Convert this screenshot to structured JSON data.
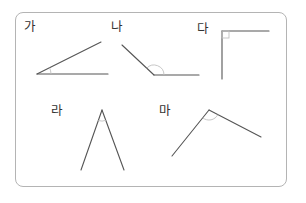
{
  "figure": {
    "border_color": "#b4b4b4",
    "line_color": "#555555",
    "mark_color": "#c0c0c0",
    "angles": [
      {
        "id": "ga",
        "label": "가",
        "type": "acute"
      },
      {
        "id": "na",
        "label": "나",
        "type": "obtuse"
      },
      {
        "id": "da",
        "label": "다",
        "type": "right"
      },
      {
        "id": "ra",
        "label": "라",
        "type": "acute"
      },
      {
        "id": "ma",
        "label": "마",
        "type": "obtuse"
      }
    ]
  }
}
